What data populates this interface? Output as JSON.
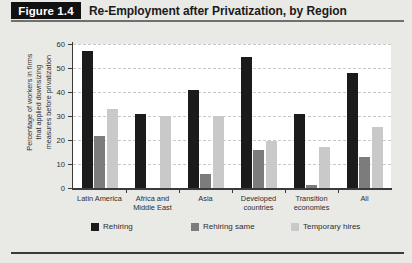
{
  "header": {
    "badge": "Figure 1.4",
    "title": "Re-Employment after Privatization, by Region"
  },
  "chart_data": {
    "type": "bar",
    "title": "Re-Employment after Privatization, by Region",
    "xlabel": "",
    "ylabel": "Percentage of workers in firms that applied downsizing measures before privatization",
    "ylabel_lines": [
      "Percentage of workers in firms",
      "that applied downsizing",
      "measures before privatization"
    ],
    "categories": [
      "Latin America",
      "Africa and Middle East",
      "Asia",
      "Developed countries",
      "Transition economies",
      "All"
    ],
    "category_lines": [
      [
        "Latin America"
      ],
      [
        "Africa and",
        "Middle East"
      ],
      [
        "Asia"
      ],
      [
        "Developed",
        "countries"
      ],
      [
        "Transition",
        "economies"
      ],
      [
        "All"
      ]
    ],
    "series": [
      {
        "name": "Rehiring",
        "color": "#1b1b1b",
        "values": [
          57,
          31,
          41,
          54.5,
          31,
          48
        ]
      },
      {
        "name": "Rehiring same",
        "color": "#7c7c7c",
        "values": [
          21.5,
          0,
          6,
          16,
          1.2,
          13
        ]
      },
      {
        "name": "Temporary hires",
        "color": "#c9c9c9",
        "values": [
          33,
          30,
          30,
          19.5,
          17,
          25.5
        ]
      }
    ],
    "ylim": [
      0,
      60
    ],
    "yticks": [
      0,
      10,
      20,
      30,
      40,
      50,
      60
    ],
    "grid": true,
    "legend_position": "bottom"
  }
}
